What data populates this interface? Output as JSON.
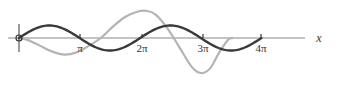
{
  "chart_data": {
    "type": "line",
    "title": "",
    "xlabel": "x",
    "ylabel": "",
    "grid": false,
    "legend": null,
    "xlim": [
      0,
      12.566
    ],
    "x_ticks": [
      {
        "value": 3.1416,
        "label": "π"
      },
      {
        "value": 6.2832,
        "label": "2π"
      },
      {
        "value": 9.4248,
        "label": "3π"
      },
      {
        "value": 12.5664,
        "label": "4π"
      }
    ],
    "tick_labels_display": [
      "π",
      "2π",
      "3π",
      "4π"
    ],
    "series": [
      {
        "name": "sin x",
        "color": "#3a3a3a",
        "stroke_width": 2.4,
        "function": "sin",
        "amplitude_px": 12.5,
        "x_range": [
          0,
          12.5664
        ]
      },
      {
        "name": "growing oscillation",
        "color": "#b4b4b4",
        "stroke_width": 2.2,
        "points_x_over_pi": [
          0,
          0.15,
          0.35,
          0.55,
          0.75,
          0.95,
          1.15,
          1.35,
          1.55,
          1.75,
          1.95,
          2.1,
          2.25,
          2.45,
          2.65,
          2.85,
          3.0,
          3.15,
          3.3,
          3.45,
          3.52
        ],
        "points_y_rel": [
          0,
          0.12,
          0.45,
          0.78,
          0.95,
          0.82,
          0.45,
          0.0,
          -0.65,
          -1.2,
          -1.5,
          -1.55,
          -1.35,
          -0.55,
          0.55,
          1.65,
          2.0,
          1.75,
          0.85,
          0.1,
          0.0
        ]
      }
    ],
    "origin_marker": "open-circle"
  },
  "axis": {
    "x_label": "x",
    "tick_labels": [
      "π",
      "2π",
      "3π",
      "4π"
    ]
  }
}
